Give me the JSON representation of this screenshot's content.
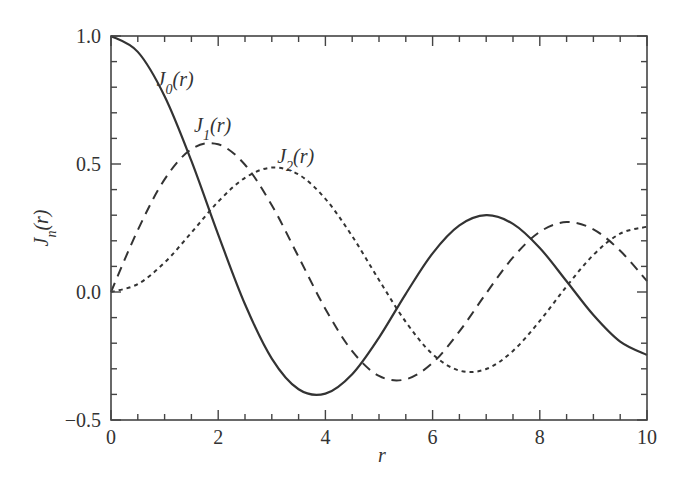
{
  "chart_data": {
    "type": "line",
    "title": "",
    "xlabel": "r",
    "ylabel": "J_n(r)",
    "xlim": [
      0,
      10
    ],
    "ylim": [
      -0.5,
      1.0
    ],
    "xticks": [
      "0",
      "2",
      "4",
      "6",
      "8",
      "10"
    ],
    "yticks": [
      "−0.5",
      "0.0",
      "0.5",
      "1.0"
    ],
    "grid": false,
    "x": [
      0,
      0.5,
      1,
      1.5,
      2,
      2.5,
      3,
      3.5,
      4,
      4.5,
      5,
      5.5,
      6,
      6.5,
      7,
      7.5,
      8,
      8.5,
      9,
      9.5,
      10
    ],
    "series": [
      {
        "name": "J0(r)",
        "style": "solid",
        "values": [
          1,
          0.938,
          0.765,
          0.512,
          0.224,
          -0.048,
          -0.26,
          -0.38,
          -0.397,
          -0.321,
          -0.178,
          -0.007,
          0.151,
          0.26,
          0.3,
          0.266,
          0.172,
          0.042,
          -0.09,
          -0.194,
          -0.246
        ]
      },
      {
        "name": "J1(r)",
        "style": "dashed",
        "values": [
          0,
          0.242,
          0.44,
          0.558,
          0.577,
          0.497,
          0.339,
          0.137,
          -0.066,
          -0.231,
          -0.328,
          -0.341,
          -0.277,
          -0.154,
          -0.005,
          0.135,
          0.235,
          0.273,
          0.245,
          0.161,
          0.043
        ]
      },
      {
        "name": "J2(r)",
        "style": "dotted",
        "values": [
          0,
          0.031,
          0.115,
          0.232,
          0.353,
          0.446,
          0.486,
          0.459,
          0.364,
          0.218,
          0.047,
          -0.117,
          -0.243,
          -0.307,
          -0.301,
          -0.23,
          -0.113,
          0.022,
          0.145,
          0.228,
          0.255
        ]
      }
    ],
    "annotations": [
      {
        "text": "J0(r)",
        "sub": "0",
        "x": 1.0,
        "y": 0.82
      },
      {
        "text": "J1(r)",
        "sub": "1",
        "x": 1.7,
        "y": 0.64
      },
      {
        "text": "J2(r)",
        "sub": "2",
        "x": 3.25,
        "y": 0.52
      }
    ]
  },
  "labels": {
    "x_axis": "r",
    "y_axis_main": "J",
    "y_axis_sub": "n",
    "y_axis_arg": "(r)",
    "curve_main": "J",
    "curve_arg": "(r)",
    "curve_subs": [
      "0",
      "1",
      "2"
    ]
  }
}
